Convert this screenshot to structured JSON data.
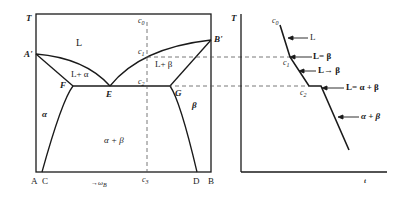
{
  "figure": {
    "left_panel": {
      "title": "Binary eutectic phase diagram",
      "axis_y_label": "T",
      "axis_x_label": "→ω",
      "axis_x_label_sub": "B",
      "points": {
        "A_prime": "A'",
        "B_prime": "B'",
        "E": "E",
        "F": "F",
        "G": "G"
      },
      "bottom_labels": {
        "A": "A",
        "C": "C",
        "c3": "c",
        "c3_sub": "3",
        "D": "D",
        "B": "B"
      },
      "composition_markers": {
        "c0": "c",
        "c0_sub": "0",
        "c1": "c",
        "c1_sub": "1",
        "c2": "c",
        "c2_sub": "2"
      },
      "regions": {
        "liquid": "L",
        "l_alpha": "L+ α",
        "l_beta": "L+ β",
        "alpha": "α",
        "beta": "β",
        "alpha_beta": "α + β"
      }
    },
    "right_panel": {
      "title": "Cooling curve",
      "axis_y_label": "T",
      "axis_x_label": "t",
      "curve_points": {
        "c0": "c",
        "c0_sub": "0",
        "c1": "c",
        "c1_sub": "1",
        "c2": "c",
        "c2_sub": "2"
      },
      "annotations": [
        {
          "label": "L"
        },
        {
          "label": "L= β"
        },
        {
          "label": "L→ β"
        },
        {
          "label": "L= α + β"
        },
        {
          "label": "α + β"
        }
      ]
    },
    "colors": {
      "line": "#1a1a1a",
      "dashed": "#555555",
      "background": "#ffffff"
    }
  }
}
